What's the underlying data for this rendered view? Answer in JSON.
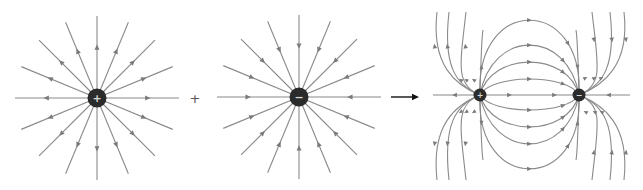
{
  "diagram": {
    "colors": {
      "background": "#ffffff",
      "field_line": "#8a8a8a",
      "arrowhead": "#7a7a7a",
      "charge": "#2b2b2b",
      "charge_sign": "#d8d8d8",
      "operator_arrow": "#111111",
      "operator_plus": "#555555"
    },
    "panels": [
      {
        "id": "positive-charge-field",
        "charge": {
          "sign": "+",
          "cx": 97,
          "cy": 98,
          "r": 9.5
        },
        "field_lines": {
          "count": 16,
          "length": 82,
          "direction": "outward"
        }
      },
      {
        "id": "negative-charge-field",
        "charge": {
          "sign": "−",
          "cx": 299,
          "cy": 97,
          "r": 9.5
        },
        "field_lines": {
          "count": 16,
          "length": 82,
          "direction": "inward"
        }
      },
      {
        "id": "dipole-field",
        "charges": [
          {
            "sign": "+",
            "cx": 480,
            "cy": 95,
            "r": 6.5
          },
          {
            "sign": "−",
            "cx": 579,
            "cy": 95,
            "r": 6.5
          }
        ],
        "inner_arc_peaks_above": [
          20,
          45,
          62,
          79
        ],
        "inner_arc_peaks_below": [
          110,
          127,
          144,
          169
        ],
        "axis_extent": [
          433,
          630
        ],
        "direction": "positive-to-negative"
      }
    ],
    "operators": [
      {
        "type": "plus",
        "symbol": "+",
        "x": 195,
        "y": 98
      },
      {
        "type": "arrow",
        "symbol": "→",
        "x1": 391,
        "x2": 419,
        "y": 97
      }
    ]
  }
}
